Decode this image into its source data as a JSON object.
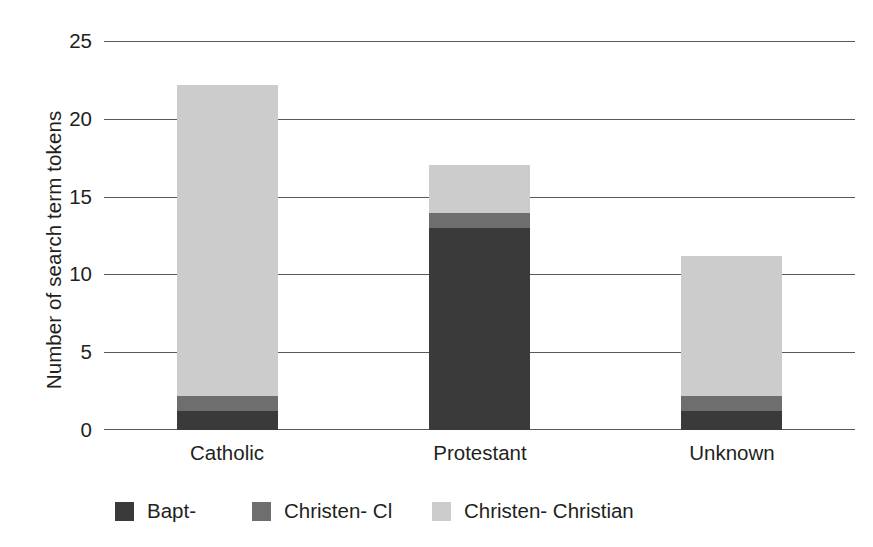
{
  "chart_data": {
    "type": "bar",
    "subtype": "stacked-bar",
    "title": "",
    "xlabel": "",
    "ylabel": "Number of search term tokens",
    "categories": [
      "Catholic",
      "Protestant",
      "Unknown"
    ],
    "ylim": [
      0,
      25
    ],
    "yticks": [
      "0",
      "5",
      "10",
      "15",
      "20",
      "25"
    ],
    "ytick_values": [
      0,
      5,
      10,
      15,
      20,
      25
    ],
    "grid": "horizontal",
    "legend_position": "bottom",
    "series": [
      {
        "name": "Bapt-",
        "color": "#3a3a3a",
        "values": [
          1.2,
          13.0,
          1.2
        ]
      },
      {
        "name": "Christen- Cl",
        "color": "#6e6e6e",
        "values": [
          1.0,
          1.0,
          1.0
        ]
      },
      {
        "name": "Christen- Christian",
        "color": "#cccccc",
        "values": [
          20.0,
          3.1,
          9.0
        ]
      }
    ],
    "totals": [
      22.2,
      17.1,
      11.2
    ]
  },
  "axis": {
    "y_title": "Number of search term tokens",
    "y_tick_0": "0",
    "y_tick_1": "5",
    "y_tick_2": "10",
    "y_tick_3": "15",
    "y_tick_4": "20",
    "y_tick_5": "25",
    "x_tick_0": "Catholic",
    "x_tick_1": "Protestant",
    "x_tick_2": "Unknown"
  },
  "legend": {
    "items": [
      {
        "label": "Bapt-",
        "color": "#3a3a3a"
      },
      {
        "label": "Christen- Cl",
        "color": "#6e6e6e"
      },
      {
        "label": "Christen- Christian",
        "color": "#cccccc"
      }
    ]
  },
  "colors": {
    "dark": "#3a3a3a",
    "mid": "#6e6e6e",
    "light": "#cccccc",
    "gridline": "#58595b",
    "text": "#231f20",
    "background": "#ffffff"
  }
}
